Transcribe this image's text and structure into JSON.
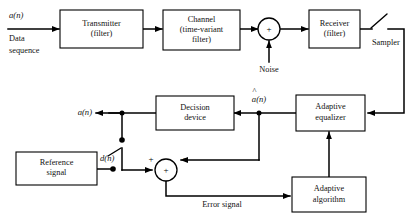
{
  "figure": {
    "type": "block-diagram",
    "background_color": "#ffffff",
    "line_color": "#000000"
  },
  "blocks": [
    {
      "id": "transmitter",
      "line1": "Transmitter",
      "line2": "(filter)"
    },
    {
      "id": "channel",
      "line1": "Channel",
      "line2": "(time-variant",
      "line3": "filter)"
    },
    {
      "id": "receiver",
      "line1": "Receiver",
      "line2": "(filter)"
    },
    {
      "id": "decision_device",
      "line1": "Decision",
      "line2": "device"
    },
    {
      "id": "adaptive_equalizer",
      "line1": "Adaptive",
      "line2": "equalizer"
    },
    {
      "id": "adaptive_algorithm",
      "line1": "Adaptive",
      "line2": "algorithm"
    },
    {
      "id": "reference_signal",
      "line1": "Reference",
      "line2": "signal"
    }
  ],
  "signals": {
    "input_symbol": "a(n)",
    "input_line1": "Data",
    "input_line2": "sequence",
    "noise": "Noise",
    "sampler": "Sampler",
    "estimate_symbol": "a(n)",
    "estimate_hat": "^",
    "output_symbol": "a(n)",
    "reference_symbol": "d(n)",
    "error": "Error signal"
  },
  "summers": {
    "noise_adder": {
      "center_sign": "+"
    },
    "error_adder": {
      "center_sign": "+",
      "left_port_sign": "+",
      "right_port_sign": "−"
    }
  }
}
